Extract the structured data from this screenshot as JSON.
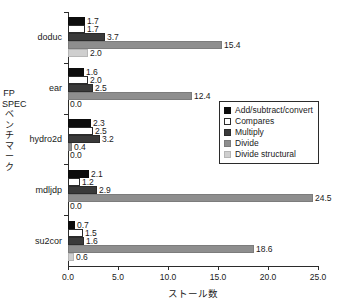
{
  "chart_data": {
    "type": "bar",
    "orientation": "horizontal",
    "title": "",
    "xlabel": "ストール数",
    "ylabel": "FP SPECベンチマーク",
    "xlim": [
      0.0,
      25.0
    ],
    "xticks": [
      "0.0",
      "5.0",
      "10.0",
      "15.0",
      "20.0",
      "25.0"
    ],
    "xtick_values": [
      0.0,
      5.0,
      10.0,
      15.0,
      20.0,
      25.0
    ],
    "grid": false,
    "legend_position": "center-right",
    "categories": [
      "doduc",
      "ear",
      "hydro2d",
      "mdljdp",
      "su2cor"
    ],
    "series": [
      {
        "name": "Add/subtract/convert",
        "color": "#0d0d0d",
        "values": [
          1.7,
          1.6,
          2.3,
          2.1,
          0.7
        ],
        "labels": [
          "1.7",
          "1.6",
          "2.3",
          "2.1",
          "0.7"
        ]
      },
      {
        "name": "Compares",
        "color": "#ffffff",
        "values": [
          1.7,
          2.0,
          2.5,
          1.2,
          1.5
        ],
        "labels": [
          "1.7",
          "2.0",
          "2.5",
          "1.2",
          "1.5"
        ]
      },
      {
        "name": "Multiply",
        "color": "#3a3a3a",
        "values": [
          3.7,
          2.5,
          3.2,
          2.9,
          1.6
        ],
        "labels": [
          "3.7",
          "2.5",
          "3.2",
          "2.9",
          "1.6"
        ]
      },
      {
        "name": "Divide",
        "color": "#8e8e8e",
        "values": [
          15.4,
          12.4,
          0.4,
          24.5,
          18.6
        ],
        "labels": [
          "15.4",
          "12.4",
          "0.4",
          "24.5",
          "18.6"
        ]
      },
      {
        "name": "Divide structural",
        "color": "#cfcfcf",
        "values": [
          2.0,
          0.0,
          0.0,
          0.0,
          0.6
        ],
        "labels": [
          "2.0",
          "0.0",
          "0.0",
          "0.0",
          "0.6"
        ]
      }
    ]
  },
  "legend": {
    "items": [
      {
        "label": "Add/subtract/convert"
      },
      {
        "label": "Compares"
      },
      {
        "label": "Multiply"
      },
      {
        "label": "Divide"
      },
      {
        "label": "Divide structural"
      }
    ]
  },
  "axes": {
    "y_title": "FP SPECベンチマーク",
    "x_title": "ストール数"
  }
}
